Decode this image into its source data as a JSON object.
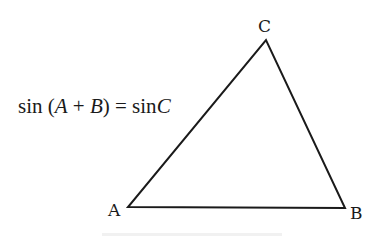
{
  "diagram": {
    "type": "triangle",
    "vertices": [
      {
        "name": "A",
        "label": "A",
        "x": 128,
        "y": 207
      },
      {
        "name": "B",
        "label": "B",
        "x": 345,
        "y": 208
      },
      {
        "name": "C",
        "label": "C",
        "x": 266,
        "y": 40
      }
    ],
    "stroke_color": "#1a1a1a",
    "background_color": "#ffffff"
  },
  "formula": {
    "fn_left": "sin",
    "open_paren": "(",
    "var_a": "A",
    "plus": "+",
    "var_b": "B",
    "close_paren": ")",
    "equals": "=",
    "fn_right": "sin",
    "var_c": "C"
  }
}
